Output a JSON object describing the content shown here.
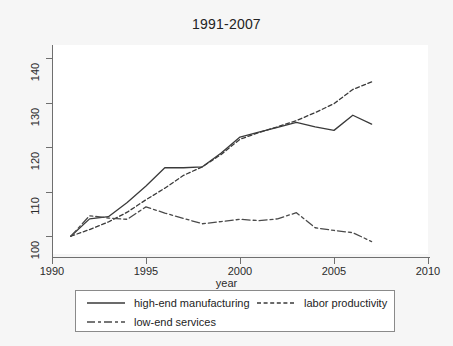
{
  "chart_data": {
    "type": "line",
    "title": "1991-2007",
    "xlabel": "year",
    "ylabel": "",
    "xlim": [
      1990,
      2010
    ],
    "ylim": [
      96,
      143
    ],
    "xticks": [
      1990,
      1995,
      2000,
      2005,
      2010
    ],
    "yticks": [
      100,
      110,
      120,
      130,
      140
    ],
    "xtick_labels": [
      "1990",
      "1995",
      "2000",
      "2005",
      "2010"
    ],
    "ytick_labels": [
      "100",
      "110",
      "120",
      "130",
      "140"
    ],
    "grid": false,
    "legend_position": "below-axes",
    "x": [
      1991,
      1992,
      1993,
      1994,
      1995,
      1996,
      1997,
      1998,
      1999,
      2000,
      2001,
      2002,
      2003,
      2004,
      2005,
      2006,
      2007
    ],
    "series": [
      {
        "name": "high-end manufacturing",
        "style": "solid",
        "color": "#3a3a3a",
        "values": [
          100.0,
          103.9,
          104.4,
          107.6,
          111.3,
          115.4,
          115.4,
          115.6,
          118.7,
          122.3,
          123.4,
          124.5,
          125.6,
          124.6,
          123.8,
          127.2,
          125.2
        ]
      },
      {
        "name": "labor productivity",
        "style": "dashed",
        "color": "#3a3a3a",
        "values": [
          100.0,
          101.5,
          103.2,
          105.4,
          108.2,
          110.8,
          113.7,
          115.6,
          118.4,
          121.8,
          123.3,
          124.6,
          126.0,
          127.8,
          129.8,
          133.0,
          134.7
        ]
      },
      {
        "name": "low-end services",
        "style": "dashdot",
        "color": "#4a4a4a",
        "values": [
          100.0,
          104.6,
          104.1,
          103.8,
          106.6,
          105.2,
          104.0,
          102.8,
          103.3,
          103.8,
          103.5,
          103.9,
          105.3,
          101.9,
          101.3,
          100.8,
          98.8
        ]
      }
    ]
  },
  "axes": {
    "y_tick_labels": [
      "140",
      "130",
      "120",
      "110",
      "100"
    ],
    "x_tick_labels": [
      "1990",
      "1995",
      "2000",
      "2005",
      "2010"
    ],
    "x_axis_title": "year"
  },
  "legend": {
    "entries": [
      {
        "label": "high-end manufacturing",
        "style": "solid"
      },
      {
        "label": "labor productivity",
        "style": "dashed"
      },
      {
        "label": "low-end services",
        "style": "dashdot"
      }
    ]
  }
}
